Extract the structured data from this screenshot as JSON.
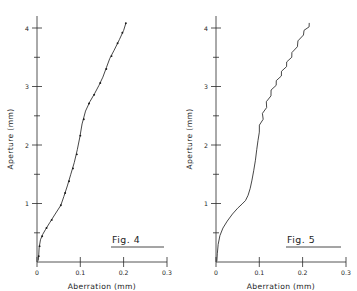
{
  "figure": {
    "panels": [
      {
        "id": "fig-4",
        "caption": "Fig. 4",
        "xlabel": "Aberration (mm)",
        "ylabel": "Aperture (mm)",
        "xticks": [
          "0",
          "0.1",
          "0.2",
          "0.3"
        ],
        "yticks": [
          "1",
          "2",
          "3",
          "4"
        ]
      },
      {
        "id": "fig-5",
        "caption": "Fig. 5",
        "xlabel": "Aberration (mm)",
        "ylabel": "Aperture (mm)",
        "xticks": [
          "0",
          "0.1",
          "0.2",
          "0.3"
        ],
        "yticks": [
          "1",
          "2",
          "3",
          "4"
        ]
      }
    ]
  },
  "chart_data": [
    {
      "type": "line",
      "title": "Fig. 4",
      "xlabel": "Aberration (mm)",
      "ylabel": "Aperture (mm)",
      "xlim": [
        0,
        0.3
      ],
      "ylim": [
        0,
        4.2
      ],
      "xticks": [
        0,
        0.1,
        0.2,
        0.3
      ],
      "yticks": [
        1,
        2,
        3,
        4
      ],
      "grid": false,
      "legend": null,
      "markers": true,
      "series": [
        {
          "name": "Fig. 4 aberration curve",
          "x": [
            0.003,
            0.004,
            0.005,
            0.008,
            0.013,
            0.02,
            0.03,
            0.042,
            0.055,
            0.062,
            0.07,
            0.078,
            0.086,
            0.093,
            0.099,
            0.104,
            0.112,
            0.122,
            0.133,
            0.143,
            0.152,
            0.16,
            0.168,
            0.178,
            0.19,
            0.2,
            0.205
          ],
          "y": [
            0.03,
            0.12,
            0.25,
            0.38,
            0.47,
            0.56,
            0.68,
            0.82,
            0.97,
            1.12,
            1.3,
            1.5,
            1.7,
            1.92,
            2.14,
            2.36,
            2.58,
            2.74,
            2.88,
            3.02,
            3.16,
            3.32,
            3.48,
            3.62,
            3.8,
            3.96,
            4.08
          ]
        }
      ],
      "scatter_points": {
        "x": [
          0.004,
          0.006,
          0.012,
          0.022,
          0.034,
          0.055,
          0.065,
          0.074,
          0.083,
          0.092,
          0.1,
          0.108,
          0.12,
          0.132,
          0.146,
          0.16,
          0.172,
          0.186,
          0.197,
          0.205
        ],
        "y": [
          0.1,
          0.27,
          0.44,
          0.58,
          0.72,
          0.97,
          1.18,
          1.38,
          1.6,
          1.84,
          2.16,
          2.44,
          2.71,
          2.86,
          3.06,
          3.3,
          3.52,
          3.74,
          3.92,
          4.08
        ]
      }
    },
    {
      "type": "line",
      "title": "Fig. 5",
      "xlabel": "Aberration (mm)",
      "ylabel": "Aperture (mm)",
      "xlim": [
        0,
        0.3
      ],
      "ylim": [
        0,
        4.2
      ],
      "xticks": [
        0,
        0.1,
        0.2,
        0.3
      ],
      "yticks": [
        1,
        2,
        3,
        4
      ],
      "grid": false,
      "legend": null,
      "markers": false,
      "series": [
        {
          "name": "Fig. 5 aberration trace",
          "x": [
            0.002,
            0.003,
            0.005,
            0.009,
            0.016,
            0.026,
            0.038,
            0.05,
            0.06,
            0.068,
            0.074,
            0.079,
            0.083,
            0.087,
            0.091,
            0.094,
            0.097,
            0.1,
            0.103,
            0.106,
            0.11,
            0.114,
            0.119,
            0.124,
            0.13,
            0.136,
            0.142,
            0.148,
            0.154,
            0.16,
            0.166,
            0.172,
            0.178,
            0.185,
            0.192,
            0.199,
            0.206,
            0.212,
            0.218
          ],
          "y": [
            0.02,
            0.14,
            0.3,
            0.45,
            0.58,
            0.7,
            0.82,
            0.92,
            0.99,
            1.05,
            1.14,
            1.26,
            1.4,
            1.56,
            1.74,
            1.92,
            2.08,
            2.22,
            2.34,
            2.44,
            2.54,
            2.64,
            2.74,
            2.84,
            2.94,
            3.02,
            3.1,
            3.18,
            3.26,
            3.34,
            3.42,
            3.5,
            3.58,
            3.68,
            3.78,
            3.88,
            3.96,
            4.02,
            4.08
          ]
        }
      ]
    }
  ]
}
